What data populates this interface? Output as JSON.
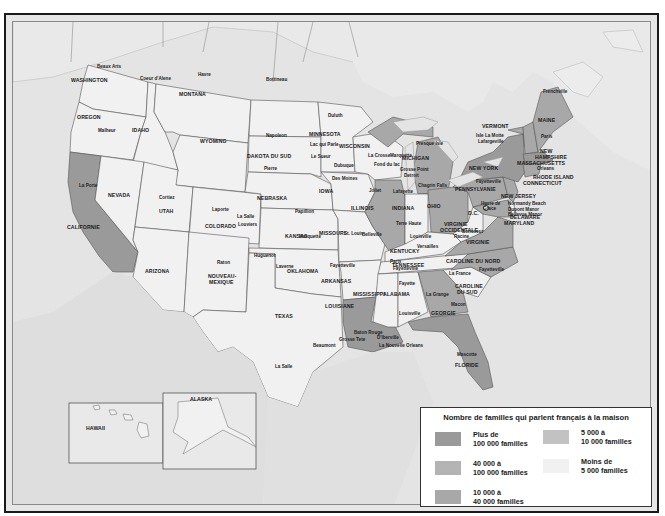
{
  "map": {
    "title": "Nombre de familles qui parlent français à la maison",
    "colors": {
      "ocean": "#e4e4e4",
      "land_other": "#e8e8e8",
      "cat1": "#9a9a9a",
      "cat2": "#b4b4b4",
      "cat3": "#a8a8a8",
      "cat4": "#c2c2c2",
      "cat5": "#f1f1f1",
      "border": "#555555"
    },
    "legend": {
      "title": "Nombre de familles qui parlent français à la maison",
      "items": [
        {
          "line1": "Plus de",
          "line2": "100 000 familles",
          "color": "#9a9a9a"
        },
        {
          "line1": "40 000 à",
          "line2": "100 000 familles",
          "color": "#b4b4b4"
        },
        {
          "line1": "10 000 à",
          "line2": "40 000 familles",
          "color": "#a8a8a8"
        },
        {
          "line1": "5 000 à",
          "line2": "10 000 familles",
          "color": "#c2c2c2"
        },
        {
          "line1": "Moins de",
          "line2": "5 000 familles",
          "color": "#f1f1f1"
        }
      ]
    },
    "states": [
      {
        "name": "WASHINGTON",
        "category": "Moins de 5 000 familles"
      },
      {
        "name": "OREGON",
        "category": "Moins de 5 000 familles"
      },
      {
        "name": "IDAHO",
        "category": "Moins de 5 000 familles"
      },
      {
        "name": "MONTANA",
        "category": "Moins de 5 000 familles"
      },
      {
        "name": "WYOMING",
        "category": "Moins de 5 000 familles"
      },
      {
        "name": "CALIFORNIE",
        "category": "Plus de 100 000 familles"
      },
      {
        "name": "NEVADA",
        "category": "Moins de 5 000 familles"
      },
      {
        "name": "UTAH",
        "category": "Moins de 5 000 familles"
      },
      {
        "name": "COLORADO",
        "category": "Moins de 5 000 familles"
      },
      {
        "name": "ARIZONA",
        "category": "Moins de 5 000 familles"
      },
      {
        "name": "NOUVEAU-MEXIQUE",
        "category": "Moins de 5 000 familles"
      },
      {
        "name": "DAKOTA DU NORD",
        "category": "Moins de 5 000 familles"
      },
      {
        "name": "DAKOTA DU SUD",
        "category": "Moins de 5 000 familles"
      },
      {
        "name": "NEBRASKA",
        "category": "Moins de 5 000 familles"
      },
      {
        "name": "KANSAS",
        "category": "Moins de 5 000 familles"
      },
      {
        "name": "OKLAHOMA",
        "category": "Moins de 5 000 familles"
      },
      {
        "name": "TEXAS",
        "category": "Moins de 5 000 familles"
      },
      {
        "name": "MINNESOTA",
        "category": "Moins de 5 000 familles"
      },
      {
        "name": "IOWA",
        "category": "Moins de 5 000 familles"
      },
      {
        "name": "MISSOURI",
        "category": "Moins de 5 000 familles"
      },
      {
        "name": "ARKANSAS",
        "category": "Moins de 5 000 familles"
      },
      {
        "name": "LOUISIANE",
        "category": "Plus de 100 000 familles"
      },
      {
        "name": "WISCONSIN",
        "category": "Moins de 5 000 familles"
      },
      {
        "name": "ILLINOIS",
        "category": "10 000 à 40 000 familles"
      },
      {
        "name": "MICHIGAN",
        "category": "10 000 à 40 000 familles"
      },
      {
        "name": "INDIANA",
        "category": "Moins de 5 000 familles"
      },
      {
        "name": "OHIO",
        "category": "10 000 à 40 000 familles"
      },
      {
        "name": "KENTUCKY",
        "category": "Moins de 5 000 familles"
      },
      {
        "name": "TENNESSEE",
        "category": "Moins de 5 000 familles"
      },
      {
        "name": "MISSISSIPPI",
        "category": "Moins de 5 000 familles"
      },
      {
        "name": "ALABAMA",
        "category": "Moins de 5 000 familles"
      },
      {
        "name": "GEORGIE",
        "category": "10 000 à 40 000 familles"
      },
      {
        "name": "FLORIDE",
        "category": "Plus de 100 000 familles"
      },
      {
        "name": "CAROLINE DU SUD",
        "category": "Moins de 5 000 familles"
      },
      {
        "name": "CAROLINE DU NORD",
        "category": "10 000 à 40 000 familles"
      },
      {
        "name": "VIRGINIE",
        "category": "10 000 à 40 000 familles"
      },
      {
        "name": "VIRGINIE OCCIDENTALE",
        "category": "Moins de 5 000 familles"
      },
      {
        "name": "PENNSYLVANIE",
        "category": "10 000 à 40 000 familles"
      },
      {
        "name": "NEW YORK",
        "category": "Plus de 100 000 familles"
      },
      {
        "name": "NEW JERSEY",
        "category": "10 000 à 40 000 familles"
      },
      {
        "name": "DELAWARE",
        "category": "Moins de 5 000 familles"
      },
      {
        "name": "MARYLAND",
        "category": "10 000 à 40 000 familles"
      },
      {
        "name": "VERMONT",
        "category": "10 000 à 40 000 familles"
      },
      {
        "name": "NEW HAMPSHIRE",
        "category": "10 000 à 40 000 familles"
      },
      {
        "name": "MAINE",
        "category": "10 000 à 40 000 familles"
      },
      {
        "name": "MASSACHUSETTS",
        "category": "Plus de 100 000 familles"
      },
      {
        "name": "RHODE ISLAND",
        "category": "10 000 à 40 000 familles"
      },
      {
        "name": "CONNECTICUT",
        "category": "10 000 à 40 000 familles"
      },
      {
        "name": "HAWAII",
        "category": "Moins de 5 000 familles"
      },
      {
        "name": "ALASKA",
        "category": "Moins de 5 000 familles"
      }
    ],
    "state_labels": {
      "washington": "WASHINGTON",
      "oregon": "OREGON",
      "idaho": "IDAHO",
      "montana": "MONTANA",
      "wyoming": "WYOMING",
      "californie": "CALIFORNIE",
      "nevada": "NEVADA",
      "utah": "UTAH",
      "colorado": "COLORADO",
      "arizona": "ARIZONA",
      "nouveau_mexique_1": "NOUVEAU-",
      "nouveau_mexique_2": "MEXIQUE",
      "dakota_nord": "DAKOTA DU NORD",
      "dakota_sud": "DAKOTA DU SUD",
      "nebraska": "NEBRASKA",
      "kansas": "KANSAS",
      "oklahoma": "OKLAHOMA",
      "texas": "TEXAS",
      "minnesota": "MINNESOTA",
      "iowa": "IOWA",
      "missouri": "MISSOURI",
      "arkansas": "ARKANSAS",
      "louisiane": "LOUISIANE",
      "wisconsin": "WISCONSIN",
      "illinois": "ILLINOIS",
      "michigan": "MICHIGAN",
      "indiana": "INDIANA",
      "ohio": "OHIO",
      "kentucky": "KENTUCKY",
      "tennessee": "TENNESSEE",
      "mississippi": "MISSISSIPPI",
      "alabama": "ALABAMA",
      "georgie": "GEORGIE",
      "floride": "FLORIDE",
      "caroline_sud_1": "CAROLINE",
      "caroline_sud_2": "DU SUD",
      "caroline_nord": "CAROLINE DU NORD",
      "virginie": "VIRGINIE",
      "virginie_occ_1": "VIRGINIE",
      "virginie_occ_2": "OCCIDENTALE",
      "pennsylvanie": "PENNSYLVANIE",
      "new_york": "NEW YORK",
      "new_jersey": "NEW JERSEY",
      "delaware": "DELAWARE",
      "maryland": "MARYLAND",
      "vermont": "VERMONT",
      "new_hampshire_1": "NEW",
      "new_hampshire_2": "HAMPSHIRE",
      "maine": "MAINE",
      "massachusetts": "MASSACHUSETTS",
      "rhode_island": "RHODE ISLAND",
      "connecticut": "CONNECTICUT",
      "dc": "D.C.",
      "hawaii": "HAWAII",
      "alaska": "ALASKA"
    },
    "cities": {
      "beaux_arts": "Beaux Arts",
      "coeur_dalene": "Coeur d'Alene",
      "havre": "Havre",
      "bottineau": "Bottineau",
      "napoleon": "Napoleon",
      "pierre": "Pierre",
      "malheur": "Malheur",
      "la_porte": "La Porte",
      "cortiez": "Cortiez",
      "laporte": "Laporte",
      "la_salle_co": "La Salle",
      "louviers": "Louviers",
      "huguenot": "Huguenot",
      "raton": "Raton",
      "laverne": "Laverne",
      "marquette_ks": "Marquette",
      "papillion": "Papillion",
      "duluth": "Duluth",
      "lac_qui_parle": "Lac qui Parle",
      "le_sueur": "Le Sueur",
      "dubuque": "Dubuque",
      "des_moines": "Des Moines",
      "la_crosse": "La Crosse",
      "marquette_wi": "Marquette",
      "fond_du_lac": "Fond du lac",
      "presque_isle": "Presque Isle",
      "grosse_pointe": "Grosse Point",
      "detroit": "Detroit",
      "joliet": "Joliet",
      "lafayette": "Lafayette",
      "chagrin_falls": "Chagrin Falls",
      "terre_haute": "Terre Haute",
      "st_louis": "St. Louis",
      "belleville": "Belleville",
      "louisville": "Louisville",
      "versailles": "Versailles",
      "paris_tn": "Paris",
      "fayetteville_tn": "Fayetteville",
      "fayetteville_ar": "Fayetteville",
      "fayette": "Fayette",
      "la_grange": "La Grange",
      "loudsville": "Louisville",
      "macon": "Macon",
      "la_france": "La France",
      "fayetteville_nc": "Fayetteville",
      "boncoeur": "Boncoeur",
      "racine": "Racine",
      "baton_rouge": "Baton Rouge",
      "grosse_tete": "Grosse Tete",
      "iberville": "D'Iberville",
      "nouvelle_orleans": "La Nouvelle Orleans",
      "beaumont": "Beaumont",
      "la_salle_tx": "La Salle",
      "mascotte": "Mascotte",
      "isle_la_motte": "Isle La Motte",
      "lafargeville": "Lafargeville",
      "paris_me": "Paris",
      "frenchville": "Frenchville",
      "orleans": "Orleans",
      "fayetteville_ny": "Fayetteville",
      "havre_de_grace_1": "Havre de",
      "havre_de_grace_2": "Grace",
      "normandy_beach": "Normandy Beach",
      "dupont_manor": "Dupont Manor",
      "bellevue_manor": "Bellevue Manor"
    }
  }
}
